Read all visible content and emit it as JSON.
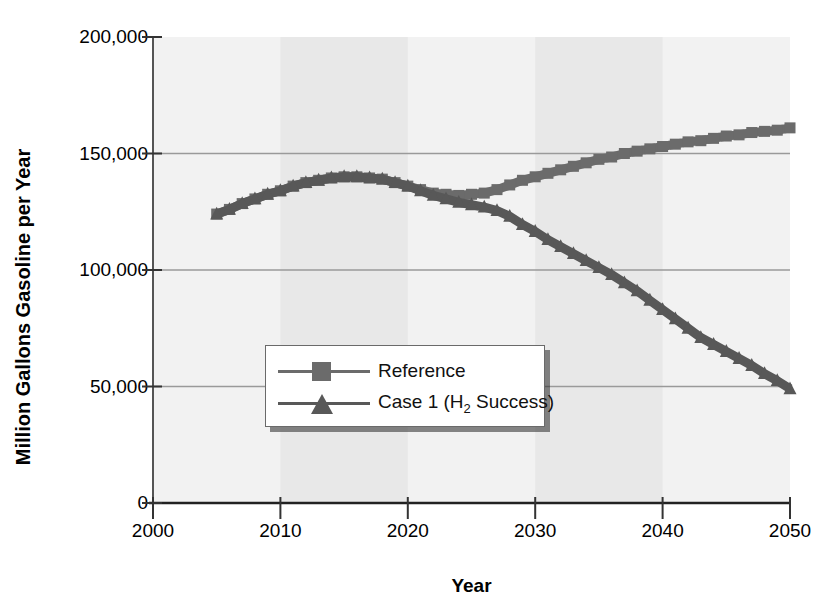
{
  "chart_data": {
    "type": "line",
    "title": "",
    "xlabel": "Year",
    "ylabel": "Million Gallons Gasoline per Year",
    "xlim": [
      2000,
      2050
    ],
    "ylim": [
      0,
      200000
    ],
    "xticks": [
      "2000",
      "2010",
      "2020",
      "2030",
      "2040",
      "2050"
    ],
    "xtick_values": [
      2000,
      2010,
      2020,
      2030,
      2040,
      2050
    ],
    "yticks": [
      "0",
      "50,000",
      "100,000",
      "150,000",
      "200,000"
    ],
    "ytick_values": [
      0,
      50000,
      100000,
      150000,
      200000
    ],
    "grid": "horizontal",
    "legend_position": "center-left",
    "x": [
      2005,
      2006,
      2007,
      2008,
      2009,
      2010,
      2011,
      2012,
      2013,
      2014,
      2015,
      2016,
      2017,
      2018,
      2019,
      2020,
      2021,
      2022,
      2023,
      2024,
      2025,
      2026,
      2027,
      2028,
      2029,
      2030,
      2031,
      2032,
      2033,
      2034,
      2035,
      2036,
      2037,
      2038,
      2039,
      2040,
      2041,
      2042,
      2043,
      2044,
      2045,
      2046,
      2047,
      2048,
      2049,
      2050
    ],
    "series": [
      {
        "name": "Reference",
        "color": "#6b6b6b",
        "marker": "square",
        "values": [
          124000,
          126000,
          128500,
          130500,
          132500,
          134000,
          136000,
          137500,
          138500,
          139500,
          140000,
          140000,
          139500,
          139000,
          137500,
          136000,
          134500,
          133000,
          132500,
          132000,
          132500,
          133000,
          134500,
          136500,
          138500,
          140000,
          141500,
          143000,
          144500,
          146000,
          147500,
          148500,
          150000,
          151000,
          152000,
          153000,
          154000,
          155000,
          155500,
          156500,
          157500,
          158000,
          159000,
          159500,
          160000,
          161000
        ]
      },
      {
        "name": "Case 1 (H2 Success)",
        "color": "#585858",
        "marker": "triangle",
        "values": [
          124000,
          126000,
          128500,
          130500,
          132500,
          134000,
          136000,
          137500,
          138500,
          139500,
          140000,
          140000,
          139500,
          139000,
          137500,
          136000,
          134000,
          132000,
          130500,
          129000,
          128000,
          127000,
          125500,
          123000,
          119500,
          116500,
          113000,
          110000,
          107000,
          104000,
          101000,
          98000,
          94500,
          91000,
          87000,
          83000,
          79000,
          75000,
          71000,
          68000,
          65000,
          62000,
          59000,
          55500,
          52500,
          49000
        ]
      }
    ],
    "band_shading": [
      {
        "from": 2010,
        "to": 2020
      },
      {
        "from": 2030,
        "to": 2040
      }
    ],
    "plot_background": "#f2f2f2",
    "band_color": "#e8e8e8",
    "gridline_color": "#9a9a9a",
    "axis_color": "#555555"
  },
  "legend": {
    "items": [
      {
        "label": "Reference",
        "sub": "",
        "tail": ""
      },
      {
        "label": "Case 1 (H",
        "sub": "2",
        "tail": " Success)"
      }
    ]
  }
}
